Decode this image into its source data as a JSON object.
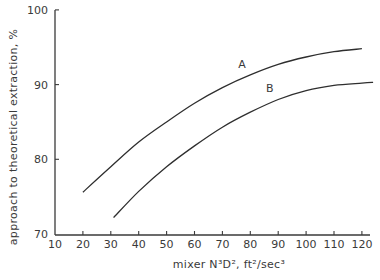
{
  "chart_data": {
    "type": "line",
    "title": "",
    "xlabel": "mixer N³D², ft²/sec³",
    "ylabel": "approach to theoretical extraction, %",
    "xlim": [
      10,
      125
    ],
    "ylim": [
      70,
      100
    ],
    "xticks": [
      10,
      20,
      30,
      40,
      50,
      60,
      70,
      80,
      90,
      100,
      110,
      120
    ],
    "yticks": [
      70,
      80,
      90,
      100
    ],
    "grid": false,
    "legend": "none (curves labeled inline)",
    "series": [
      {
        "name": "A",
        "x": [
          20,
          30,
          40,
          50,
          60,
          70,
          80,
          90,
          100,
          110,
          120
        ],
        "values": [
          75.6,
          79.0,
          82.3,
          85.0,
          87.5,
          89.6,
          91.3,
          92.7,
          93.7,
          94.4,
          94.8
        ],
        "label_position": {
          "x": 77,
          "y": 92.2
        }
      },
      {
        "name": "B",
        "x": [
          31,
          40,
          50,
          60,
          70,
          80,
          90,
          100,
          110,
          120,
          124
        ],
        "values": [
          72.2,
          75.7,
          79.0,
          81.8,
          84.3,
          86.3,
          88.0,
          89.2,
          89.9,
          90.2,
          90.3
        ],
        "label_position": {
          "x": 87,
          "y": 89.0
        }
      }
    ]
  },
  "axes": {
    "x_title": "mixer N³D², ft²/sec³",
    "y_title": "approach to theoretical extraction, %"
  },
  "colors": {
    "ink": "#2e2e2e",
    "background": "#ffffff"
  }
}
